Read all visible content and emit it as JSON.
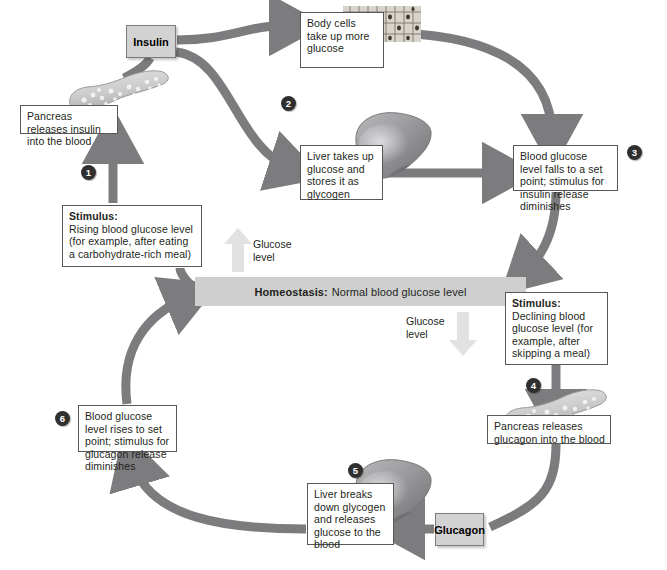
{
  "diagram": {
    "homeostasis": {
      "label_bold": "Homeostasis:",
      "label_rest": "Normal blood glucose level"
    },
    "hormones": {
      "insulin": "Insulin",
      "glucagon": "Glucagon"
    },
    "glucose_arrows": [
      {
        "name": "glucose-level-up",
        "line1": "Glucose",
        "line2": "level"
      },
      {
        "name": "glucose-level-down",
        "line1": "Glucose",
        "line2": "level"
      }
    ],
    "steps": [
      {
        "number": "1"
      },
      {
        "number": "2"
      },
      {
        "number": "3"
      },
      {
        "number": "4"
      },
      {
        "number": "5"
      },
      {
        "number": "6"
      }
    ],
    "boxes": {
      "pancreas_insulin": "Pancreas releases insulin into the blood",
      "stimulus_rising_bold": "Stimulus:",
      "stimulus_rising_text": "Rising blood glucose level (for example, after eating a carbohydrate-rich meal)",
      "body_cells": "Body cells take up more glucose",
      "liver_takes_up": "Liver takes up glucose and stores it as glycogen",
      "blood_glucose_falls": "Blood glucose level falls to a set point; stimulus for insulin release diminishes",
      "stimulus_declining_bold": "Stimulus:",
      "stimulus_declining_text": "Declining blood glucose level (for example, after skipping a meal)",
      "pancreas_glucagon": "Pancreas releases glucagon into the blood",
      "liver_breaks_down": "Liver breaks down glycogen and releases glucose to the blood",
      "blood_glucose_rises": "Blood glucose level rises to set point; stimulus for glucagon release diminishes"
    },
    "organs": {
      "pancreas_top": "pancreas-illustration",
      "pancreas_bottom": "pancreas-illustration",
      "liver_top": "liver-illustration",
      "liver_bottom": "liver-illustration",
      "body_cells_image": "epithelial-cells-illustration"
    },
    "colors": {
      "arrow_gray": "#7c7c7e",
      "homeostasis_bar": "#cfcfcf",
      "hormone_box": "#d2d2d2",
      "pale_arrow": "#e2e2e2",
      "step_circle": "#2f2f2f",
      "box_border": "#58585a",
      "text": "#231f20",
      "liver": "#8e8e90",
      "pancreas": "#c9c9c9"
    }
  }
}
